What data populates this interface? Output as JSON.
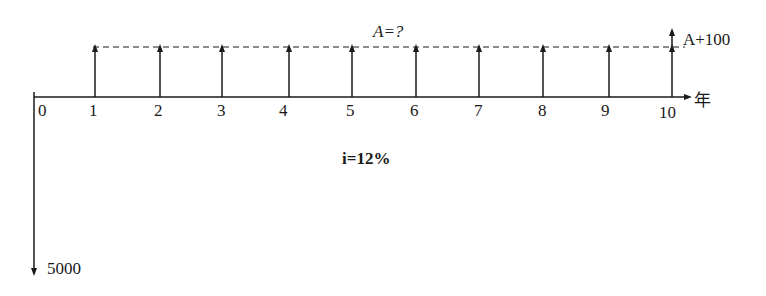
{
  "diagram": {
    "type": "cash-flow-diagram",
    "axis": {
      "unit_label": "年",
      "periods": [
        "0",
        "1",
        "2",
        "3",
        "4",
        "5",
        "6",
        "7",
        "8",
        "9",
        "10"
      ]
    },
    "annuity_label": "A=?",
    "final_label": "A+100",
    "interest_label": "i=12%",
    "initial_outflow_label": "5000"
  },
  "colors": {
    "line": "#1a1a1a",
    "background": "#ffffff"
  }
}
